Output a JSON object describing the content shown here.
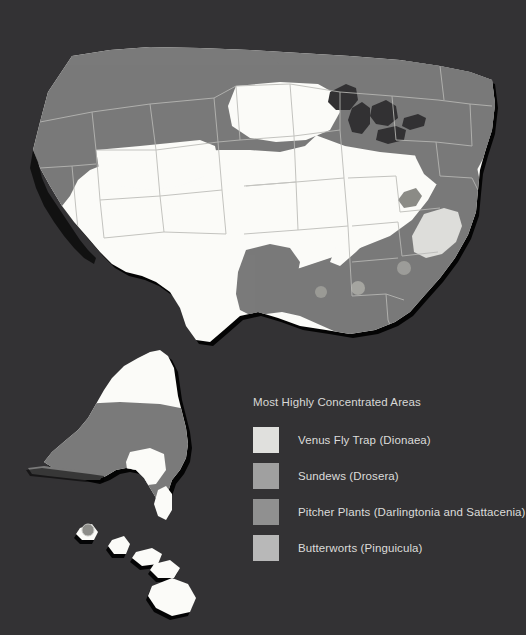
{
  "background_color": "#333234",
  "map": {
    "title": "Carnivorous Plant Distribution Map of the United States",
    "land_color": "#fbfbf8",
    "shaded_color": "#7a7a7a",
    "highlight_color": "#ddddda",
    "accent_color": "#b9b9b4",
    "border_color": "#b9b9b6",
    "shadow_color": "#000000",
    "regions": [
      {
        "name": "pacific-northwest",
        "states": "Washington, Oregon, Idaho, Montana, northern California"
      },
      {
        "name": "great-lakes-upper-midwest",
        "states": "Minnesota, Wisconsin, Michigan"
      },
      {
        "name": "northeast",
        "states": "New England, New York, Pennsylvania, New Jersey"
      },
      {
        "name": "southeast-gulf-coast",
        "states": "Virginia, Carolinas, Georgia, Florida, Alabama, Mississippi, Louisiana, east Texas"
      },
      {
        "name": "alaska-south",
        "states": "southern Alaska"
      }
    ],
    "insets": [
      "Alaska",
      "Hawaii"
    ]
  },
  "legend": {
    "title": "Most Highly Concentrated Areas",
    "items": [
      {
        "label": "Venus Fly Trap (Dionaea)",
        "color": "#e0e0dd"
      },
      {
        "label": "Sundews (Drosera)",
        "color": "#a0a0a0"
      },
      {
        "label": "Pitcher Plants (Darlingtonia and Sattacenia)",
        "color": "#909090"
      },
      {
        "label": "Butterworts (Pinguicula)",
        "color": "#b8b8b8"
      }
    ]
  }
}
